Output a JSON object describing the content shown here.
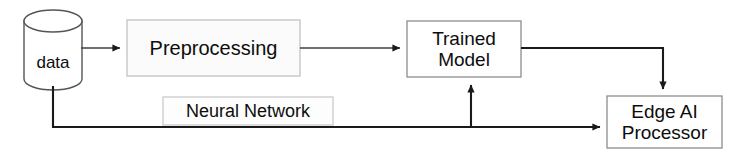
{
  "diagram": {
    "canvas": {
      "width": 738,
      "height": 159,
      "background": "#ffffff"
    },
    "colors": {
      "stroke": "#3f3f3f",
      "connector": "#1a1a1a",
      "box_fill": "#fbfbfb",
      "box_stroke": "#b8b8b8",
      "text": "#0d0d0d"
    },
    "nodes": [
      {
        "id": "data",
        "shape": "cylinder",
        "label": "data",
        "x": 24,
        "y": 10,
        "width": 58,
        "height": 80
      },
      {
        "id": "preprocessing",
        "shape": "rectangle",
        "label": "Preprocessing",
        "x": 127,
        "y": 20,
        "width": 173,
        "height": 56
      },
      {
        "id": "trained_model",
        "shape": "rectangle",
        "label": "Trained\nModel",
        "x": 407,
        "y": 21,
        "width": 114,
        "height": 56
      },
      {
        "id": "edge_ai_processor",
        "shape": "rectangle",
        "label": "Edge AI\nProcessor",
        "x": 607,
        "y": 96,
        "width": 115,
        "height": 52
      },
      {
        "id": "neural_network",
        "shape": "label-box",
        "label": "Neural Network",
        "x": 163,
        "y": 97,
        "width": 170,
        "height": 28
      }
    ],
    "edges": [
      {
        "id": "data-to-preprocessing",
        "from": "data",
        "to": "preprocessing",
        "arrow": true
      },
      {
        "id": "preprocessing-to-trained-model",
        "from": "preprocessing",
        "to": "trained_model",
        "arrow": true
      },
      {
        "id": "trained-model-to-edge-ai",
        "from": "trained_model",
        "to": "edge_ai_processor",
        "arrow": true
      },
      {
        "id": "data-to-edge-ai-feedback",
        "from": "data",
        "to": "edge_ai_processor",
        "arrow": true
      },
      {
        "id": "feedback-branch-to-trained-model",
        "from": "data",
        "to": "trained_model",
        "arrow": true
      }
    ]
  }
}
